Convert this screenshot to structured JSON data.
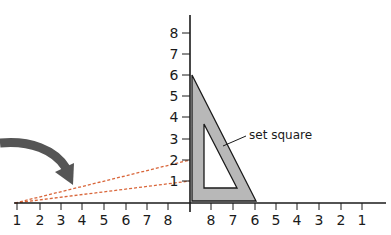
{
  "diagram": {
    "label": "set square",
    "y_axis_labels": [
      "1",
      "2",
      "3",
      "4",
      "5",
      "6",
      "7",
      "8"
    ],
    "x_left_labels": [
      "1",
      "2",
      "3",
      "4",
      "5",
      "6",
      "7",
      "8"
    ],
    "x_right_labels": [
      "8",
      "7",
      "6",
      "5",
      "4",
      "3",
      "2",
      "1"
    ],
    "colors": {
      "axis": "#1a1a1a",
      "set_square_fill": "#b8b8b8",
      "dashed_lines": "#d9663a",
      "arrow": "#555555"
    }
  }
}
